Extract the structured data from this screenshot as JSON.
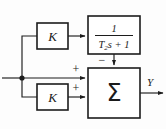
{
  "diagram": {
    "type": "block-diagram",
    "background_color": "#fdfdfd",
    "line_color": "#1c1c1c",
    "blocks": [
      {
        "id": "gain-top",
        "label": "K",
        "shape": "rectangle",
        "x": 37,
        "y": 23,
        "w": 31,
        "h": 26
      },
      {
        "id": "lag-filter",
        "label_numerator": "1",
        "label_denominator": "T₂s + 1",
        "denominator_base": "T",
        "denominator_subscript": "2",
        "denominator_rest": "s + 1",
        "shape": "rectangle",
        "x": 88,
        "y": 16,
        "w": 52,
        "h": 38
      },
      {
        "id": "gain-bottom",
        "label": "K",
        "shape": "rectangle",
        "x": 37,
        "y": 84,
        "w": 31,
        "h": 26
      },
      {
        "id": "summer",
        "label": "Σ",
        "shape": "rectangle",
        "x": 88,
        "y": 68,
        "w": 52,
        "h": 50
      }
    ],
    "signs": [
      {
        "id": "sign-feedback",
        "label": "−",
        "x": 102,
        "y": 62
      },
      {
        "id": "sign-direct",
        "label": "+",
        "x": 76,
        "y": 70
      },
      {
        "id": "sign-gain-bottom",
        "label": "+",
        "x": 76,
        "y": 89
      }
    ],
    "signals": [
      {
        "id": "output-signal",
        "label": "Y",
        "x": 150,
        "y": 85
      }
    ],
    "nodes": [
      {
        "id": "input-branch-node",
        "x": 22,
        "y": 78,
        "r": 2.6
      }
    ],
    "wires": [
      {
        "id": "input-wire",
        "from": "input-left",
        "to": "input-branch-node"
      },
      {
        "id": "upper-branch-wire",
        "from": "input-branch-node",
        "to": "gain-top"
      },
      {
        "id": "gain-top-to-filter-wire",
        "from": "gain-top",
        "to": "lag-filter"
      },
      {
        "id": "filter-to-summer-wire",
        "from": "lag-filter",
        "to": "summer-top"
      },
      {
        "id": "direct-feed-wire",
        "from": "input-branch-node",
        "to": "summer-left"
      },
      {
        "id": "lower-branch-wire",
        "from": "input-branch-node",
        "to": "gain-bottom"
      },
      {
        "id": "gain-bottom-to-summer-wire",
        "from": "gain-bottom",
        "to": "summer-left-lower"
      },
      {
        "id": "summer-output-wire",
        "from": "summer",
        "to": "output-right"
      }
    ]
  }
}
